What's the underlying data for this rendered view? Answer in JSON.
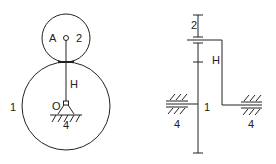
{
  "diagram": {
    "type": "planetary gear train kinematic sketch",
    "colors": {
      "stroke": "#222222",
      "background": "#ffffff"
    },
    "front_view": {
      "labels": {
        "gear1": "1",
        "gear2": "2",
        "pivot_a": "A",
        "carrier": "H",
        "center_o": "O",
        "frame": "4"
      }
    },
    "side_view": {
      "labels": {
        "gear2": "2",
        "carrier": "H",
        "gear1": "1",
        "frame_left": "4",
        "frame_right": "4"
      }
    }
  }
}
